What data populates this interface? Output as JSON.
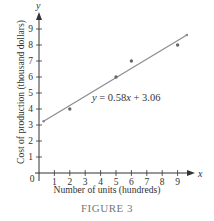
{
  "chart_data": {
    "type": "scatter",
    "title": "",
    "caption": "FIGURE 3",
    "xlabel": "Number of units (hundreds)",
    "ylabel": "Cost of production (thousand dollars)",
    "x_axis_name": "x",
    "y_axis_name": "y",
    "origin_label": "0",
    "xlim": [
      0,
      10
    ],
    "ylim": [
      0,
      10
    ],
    "x_ticks": [
      1,
      2,
      3,
      4,
      5,
      6,
      7,
      8,
      9
    ],
    "y_ticks": [
      1,
      2,
      3,
      4,
      5,
      6,
      7,
      8,
      9
    ],
    "grid": false,
    "points": [
      {
        "x": 2,
        "y": 4
      },
      {
        "x": 5,
        "y": 6
      },
      {
        "x": 6,
        "y": 7
      },
      {
        "x": 9,
        "y": 8
      }
    ],
    "regression_line": {
      "equation": "y = 0.58x + 3.06",
      "slope": 0.58,
      "intercept": 3.06,
      "x_range": [
        0.3,
        9.6
      ]
    },
    "colors": {
      "axis": "#333333",
      "line": "#8a8a8a",
      "points": "#666666"
    }
  },
  "labels": {
    "equation": "y = 0.58x + 3.06",
    "xlabel": "Number of units (hundreds)",
    "ylabel": "Cost of production (thousand dollars)",
    "caption": "FIGURE 3"
  }
}
